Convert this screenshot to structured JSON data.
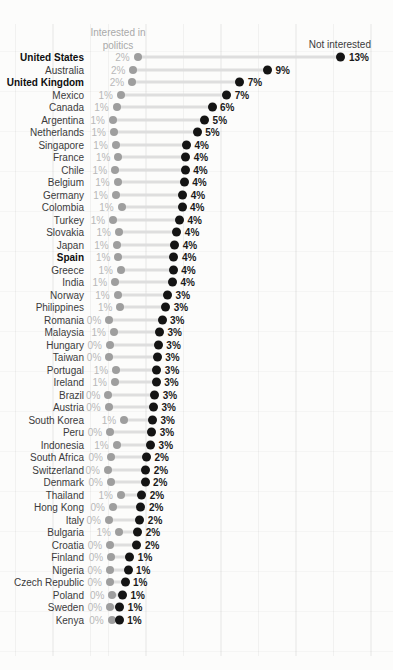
{
  "header": {
    "interested_line1": "Interested in",
    "interested_line2": "politics",
    "not_interested": "Not interested"
  },
  "chart_data": {
    "type": "dumbbell",
    "title": "",
    "series_labels": {
      "left": "Interested in politics",
      "right": "Not interested"
    },
    "unit": "%",
    "x_axis": {
      "min": 0,
      "max": 14
    },
    "legend_position": "top",
    "colors": {
      "interested_dot": "#9e9e9e",
      "not_interested_dot": "#141414",
      "connector": "#dedede",
      "interested_label": "#b8b8b8",
      "not_interested_label": "#1a1a1a",
      "country_label": "#3b3b3b",
      "header_gray": "#a9a9a9",
      "background": "#fcfcfb"
    },
    "rows": [
      {
        "country": "United States",
        "bold": true,
        "interested": {
          "label": "2%",
          "value": 1.98
        },
        "not_interested": {
          "label": "13%",
          "value": 12.97
        }
      },
      {
        "country": "Australia",
        "bold": false,
        "interested": {
          "label": "2%",
          "value": 1.75
        },
        "not_interested": {
          "label": "9%",
          "value": 9.0
        }
      },
      {
        "country": "United Kingdom",
        "bold": true,
        "interested": {
          "label": "2%",
          "value": 1.68
        },
        "not_interested": {
          "label": "7%",
          "value": 7.5
        }
      },
      {
        "country": "Mexico",
        "bold": false,
        "interested": {
          "label": "1%",
          "value": 1.08
        },
        "not_interested": {
          "label": "7%",
          "value": 6.8
        }
      },
      {
        "country": "Canada",
        "bold": false,
        "interested": {
          "label": "1%",
          "value": 0.85
        },
        "not_interested": {
          "label": "6%",
          "value": 6.0
        }
      },
      {
        "country": "Argentina",
        "bold": false,
        "interested": {
          "label": "1%",
          "value": 0.64
        },
        "not_interested": {
          "label": "5%",
          "value": 5.6
        }
      },
      {
        "country": "Netherlands",
        "bold": false,
        "interested": {
          "label": "1%",
          "value": 0.7
        },
        "not_interested": {
          "label": "5%",
          "value": 5.2
        }
      },
      {
        "country": "Singapore",
        "bold": false,
        "interested": {
          "label": "1%",
          "value": 0.8
        },
        "not_interested": {
          "label": "4%",
          "value": 4.62
        }
      },
      {
        "country": "France",
        "bold": false,
        "interested": {
          "label": "1%",
          "value": 0.94
        },
        "not_interested": {
          "label": "4%",
          "value": 4.58
        }
      },
      {
        "country": "Chile",
        "bold": false,
        "interested": {
          "label": "1%",
          "value": 0.76
        },
        "not_interested": {
          "label": "4%",
          "value": 4.55
        }
      },
      {
        "country": "Belgium",
        "bold": false,
        "interested": {
          "label": "1%",
          "value": 0.9
        },
        "not_interested": {
          "label": "4%",
          "value": 4.5
        }
      },
      {
        "country": "Germany",
        "bold": false,
        "interested": {
          "label": "1%",
          "value": 0.8
        },
        "not_interested": {
          "label": "4%",
          "value": 4.42
        }
      },
      {
        "country": "Colombia",
        "bold": false,
        "interested": {
          "label": "1%",
          "value": 1.12
        },
        "not_interested": {
          "label": "4%",
          "value": 4.38
        }
      },
      {
        "country": "Turkey",
        "bold": false,
        "interested": {
          "label": "1%",
          "value": 0.66
        },
        "not_interested": {
          "label": "4%",
          "value": 4.24
        }
      },
      {
        "country": "Slovakia",
        "bold": false,
        "interested": {
          "label": "1%",
          "value": 0.97
        },
        "not_interested": {
          "label": "4%",
          "value": 4.1
        }
      },
      {
        "country": "Japan",
        "bold": false,
        "interested": {
          "label": "1%",
          "value": 0.85
        },
        "not_interested": {
          "label": "4%",
          "value": 3.98
        }
      },
      {
        "country": "Spain",
        "bold": true,
        "interested": {
          "label": "1%",
          "value": 0.94
        },
        "not_interested": {
          "label": "4%",
          "value": 3.94
        }
      },
      {
        "country": "Greece",
        "bold": false,
        "interested": {
          "label": "1%",
          "value": 1.08
        },
        "not_interested": {
          "label": "4%",
          "value": 3.9
        }
      },
      {
        "country": "India",
        "bold": false,
        "interested": {
          "label": "1%",
          "value": 0.76
        },
        "not_interested": {
          "label": "4%",
          "value": 3.86
        }
      },
      {
        "country": "Norway",
        "bold": false,
        "interested": {
          "label": "1%",
          "value": 0.9
        },
        "not_interested": {
          "label": "3%",
          "value": 3.6
        }
      },
      {
        "country": "Philippines",
        "bold": false,
        "interested": {
          "label": "1%",
          "value": 1.05
        },
        "not_interested": {
          "label": "3%",
          "value": 3.5
        }
      },
      {
        "country": "Romania",
        "bold": false,
        "interested": {
          "label": "0%",
          "value": 0.45
        },
        "not_interested": {
          "label": "3%",
          "value": 3.3
        }
      },
      {
        "country": "Malaysia",
        "bold": false,
        "interested": {
          "label": "1%",
          "value": 0.7
        },
        "not_interested": {
          "label": "3%",
          "value": 3.16
        }
      },
      {
        "country": "Hungary",
        "bold": false,
        "interested": {
          "label": "0%",
          "value": 0.48
        },
        "not_interested": {
          "label": "3%",
          "value": 3.1
        }
      },
      {
        "country": "Taiwan",
        "bold": false,
        "interested": {
          "label": "0%",
          "value": 0.45
        },
        "not_interested": {
          "label": "3%",
          "value": 3.04
        }
      },
      {
        "country": "Portugal",
        "bold": false,
        "interested": {
          "label": "1%",
          "value": 0.82
        },
        "not_interested": {
          "label": "3%",
          "value": 3.02
        }
      },
      {
        "country": "Ireland",
        "bold": false,
        "interested": {
          "label": "1%",
          "value": 0.75
        },
        "not_interested": {
          "label": "3%",
          "value": 2.98
        }
      },
      {
        "country": "Brazil",
        "bold": false,
        "interested": {
          "label": "0%",
          "value": 0.4
        },
        "not_interested": {
          "label": "3%",
          "value": 2.9
        }
      },
      {
        "country": "Austria",
        "bold": false,
        "interested": {
          "label": "0%",
          "value": 0.42
        },
        "not_interested": {
          "label": "3%",
          "value": 2.84
        }
      },
      {
        "country": "South Korea",
        "bold": false,
        "interested": {
          "label": "1%",
          "value": 1.25
        },
        "not_interested": {
          "label": "3%",
          "value": 2.78
        }
      },
      {
        "country": "Peru",
        "bold": false,
        "interested": {
          "label": "0%",
          "value": 0.5
        },
        "not_interested": {
          "label": "3%",
          "value": 2.74
        }
      },
      {
        "country": "Indonesia",
        "bold": false,
        "interested": {
          "label": "1%",
          "value": 0.85
        },
        "not_interested": {
          "label": "3%",
          "value": 2.68
        }
      },
      {
        "country": "South Africa",
        "bold": false,
        "interested": {
          "label": "0%",
          "value": 0.54
        },
        "not_interested": {
          "label": "2%",
          "value": 2.46
        }
      },
      {
        "country": "Switzerland",
        "bold": false,
        "interested": {
          "label": "0%",
          "value": 0.38
        },
        "not_interested": {
          "label": "2%",
          "value": 2.42
        }
      },
      {
        "country": "Denmark",
        "bold": false,
        "interested": {
          "label": "0%",
          "value": 0.54
        },
        "not_interested": {
          "label": "2%",
          "value": 2.38
        }
      },
      {
        "country": "Thailand",
        "bold": false,
        "interested": {
          "label": "1%",
          "value": 1.08
        },
        "not_interested": {
          "label": "2%",
          "value": 2.2
        }
      },
      {
        "country": "Hong Kong",
        "bold": false,
        "interested": {
          "label": "0%",
          "value": 0.65
        },
        "not_interested": {
          "label": "2%",
          "value": 2.16
        }
      },
      {
        "country": "Italy",
        "bold": false,
        "interested": {
          "label": "0%",
          "value": 0.43
        },
        "not_interested": {
          "label": "2%",
          "value": 2.1
        }
      },
      {
        "country": "Bulgaria",
        "bold": false,
        "interested": {
          "label": "1%",
          "value": 0.97
        },
        "not_interested": {
          "label": "2%",
          "value": 1.98
        }
      },
      {
        "country": "Croatia",
        "bold": false,
        "interested": {
          "label": "0%",
          "value": 0.5
        },
        "not_interested": {
          "label": "2%",
          "value": 1.94
        }
      },
      {
        "country": "Finland",
        "bold": false,
        "interested": {
          "label": "0%",
          "value": 0.55
        },
        "not_interested": {
          "label": "1%",
          "value": 1.56
        }
      },
      {
        "country": "Nigeria",
        "bold": false,
        "interested": {
          "label": "0%",
          "value": 0.48
        },
        "not_interested": {
          "label": "1%",
          "value": 1.46
        }
      },
      {
        "country": "Czech Republic",
        "bold": false,
        "interested": {
          "label": "0%",
          "value": 0.48
        },
        "not_interested": {
          "label": "1%",
          "value": 1.3
        }
      },
      {
        "country": "Poland",
        "bold": false,
        "interested": {
          "label": "0%",
          "value": 0.62
        },
        "not_interested": {
          "label": "1%",
          "value": 1.16
        }
      },
      {
        "country": "Sweden",
        "bold": false,
        "interested": {
          "label": "0%",
          "value": 0.5
        },
        "not_interested": {
          "label": "1%",
          "value": 1.02
        }
      },
      {
        "country": "Kenya",
        "bold": false,
        "interested": {
          "label": "0%",
          "value": 0.58
        },
        "not_interested": {
          "label": "1%",
          "value": 0.98
        }
      }
    ]
  }
}
